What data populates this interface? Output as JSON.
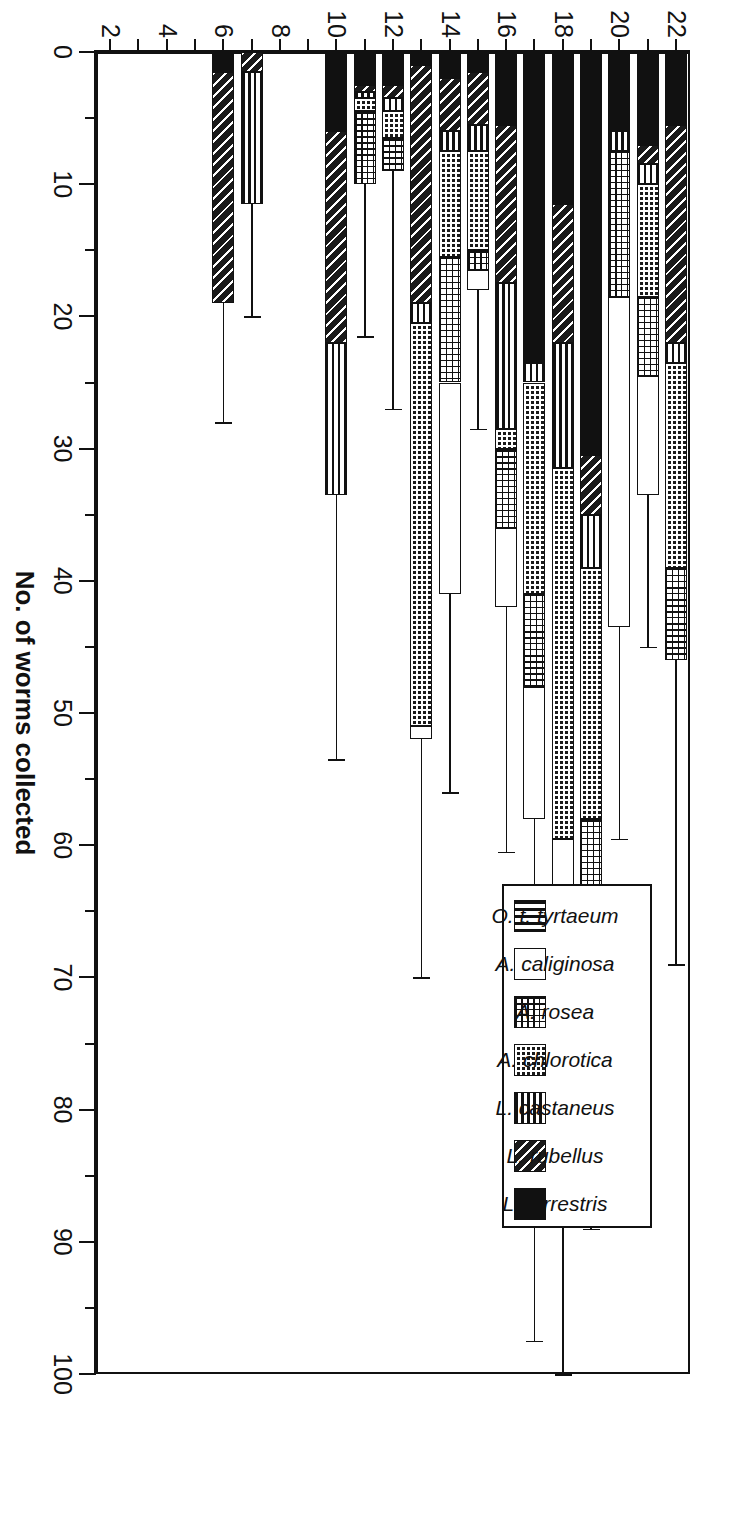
{
  "chart_data": {
    "type": "bar",
    "orientation": "horizontal-stacked",
    "title": "",
    "xlabel": "No. of worms collected",
    "ylabel": "Site",
    "xlim": [
      0,
      100
    ],
    "xticks": [
      0,
      2,
      4,
      6,
      8,
      10,
      12,
      14,
      16,
      18,
      20,
      22
    ],
    "xtick_labels": [
      "0",
      "2",
      "4",
      "6",
      "8",
      "10",
      "12",
      "14",
      "16",
      "18",
      "20",
      "22"
    ],
    "value_axis_ticks": [
      0,
      10,
      20,
      30,
      40,
      50,
      60,
      70,
      80,
      90,
      100
    ],
    "value_axis_minor_step": 5,
    "grid": false,
    "legend_position": "upper-right",
    "categories": [
      "22",
      "21",
      "20",
      "19",
      "18",
      "17",
      "16",
      "15",
      "14",
      "13",
      "12",
      "11",
      "10",
      "9",
      "8",
      "7",
      "6",
      "5",
      "4",
      "3",
      "2"
    ],
    "series": [
      {
        "name": "O. t. tyrtaeum",
        "pattern": "vertical-stripes",
        "values": [
          0,
          0,
          0,
          0,
          0,
          0,
          0,
          0,
          0,
          0,
          0,
          0,
          0,
          0,
          0,
          0,
          0,
          0,
          0,
          0,
          0
        ]
      },
      {
        "name": "A. caliginosa",
        "pattern": "open-white",
        "values": [
          0,
          9,
          25,
          0,
          8.5,
          10,
          6,
          1.5,
          16,
          1,
          0,
          0,
          0,
          0,
          0,
          0,
          0,
          0,
          0,
          0,
          0
        ]
      },
      {
        "name": "A. rosea",
        "pattern": "open-dotted-grid",
        "values": [
          7,
          6,
          11,
          10,
          0,
          7,
          6,
          1.5,
          9.5,
          0,
          2.5,
          5.5,
          0,
          0,
          0,
          0,
          0,
          0,
          0,
          0,
          0
        ]
      },
      {
        "name": "A. chlorotica",
        "pattern": "dark-dotted-grid",
        "values": [
          15.5,
          8.5,
          0,
          19,
          28,
          16,
          1.5,
          7.5,
          8,
          30.5,
          2,
          1,
          0,
          0,
          0,
          0,
          0,
          0,
          0,
          0,
          0
        ]
      },
      {
        "name": "L. castaneus",
        "pattern": "horizontal-stripes",
        "values": [
          1.5,
          1.5,
          1.5,
          4,
          9.5,
          1.5,
          11,
          2,
          1.5,
          1.5,
          1,
          0.5,
          11.5,
          0,
          0,
          10,
          0,
          0,
          0,
          0,
          0
        ]
      },
      {
        "name": "L. rubellus",
        "pattern": "diagonal-hatch",
        "values": [
          16.5,
          1.5,
          0,
          4.5,
          10.5,
          0,
          12,
          4,
          4,
          18,
          1,
          0.5,
          16,
          0,
          0,
          1.5,
          17.5,
          0,
          0,
          0,
          0
        ]
      },
      {
        "name": "L. terrestris",
        "pattern": "solid-black",
        "values": [
          5.5,
          7,
          6,
          30.5,
          11.5,
          23.5,
          5.5,
          1.5,
          2,
          1,
          2.5,
          2.5,
          6,
          0,
          0,
          0,
          1.5,
          0,
          0,
          0,
          0
        ]
      }
    ],
    "totals": [
      46,
      33.5,
      43.5,
      68,
      68,
      58,
      42,
      18,
      41,
      52,
      9,
      10,
      33.5,
      0,
      0,
      11.5,
      19,
      0,
      0,
      0,
      0
    ],
    "error_bars_upper": [
      69,
      45,
      59.5,
      89,
      100,
      97.5,
      60.5,
      28.5,
      56,
      70,
      27,
      21.5,
      53.5,
      0,
      0,
      20,
      28,
      0,
      0,
      0,
      0
    ]
  },
  "legend": {
    "items": [
      {
        "label": "O. t. tyrtaeum",
        "swatch": "vertical-stripes"
      },
      {
        "label": "A. caliginosa",
        "swatch": "open-white"
      },
      {
        "label": "A. rosea",
        "swatch": "open-dotted-grid"
      },
      {
        "label": "A. chlorotica",
        "swatch": "dark-dotted-grid"
      },
      {
        "label": "L. castaneus",
        "swatch": "horizontal-stripes"
      },
      {
        "label": "L. rubellus",
        "swatch": "diagonal-hatch"
      },
      {
        "label": "L. terrestris",
        "swatch": "solid-black"
      }
    ]
  },
  "axis": {
    "value_title": "No. of worms collected",
    "category_title": "Site"
  },
  "colors": {
    "ink": "#111111",
    "paper": "#ffffff"
  }
}
